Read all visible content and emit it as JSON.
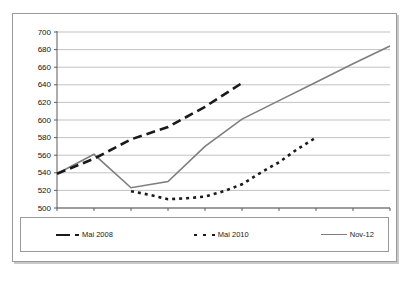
{
  "chart_data": {
    "type": "line",
    "title": "",
    "subtitle": "",
    "xlabel": "",
    "ylabel": "",
    "xlim": [
      2007,
      2016
    ],
    "ylim": [
      500,
      700
    ],
    "ytick_step": 20,
    "grid": true,
    "legend_position": "bottom",
    "categories": [
      2007,
      2008,
      2009,
      2010,
      2011,
      2012,
      2013,
      2014,
      2015,
      2016
    ],
    "xtick_labels": [
      "2007",
      "2008",
      "2009",
      "2010",
      "2011",
      "2012",
      "2013",
      "2014",
      "2015",
      "2016"
    ],
    "ytick_labels": [
      "500",
      "520",
      "540",
      "560",
      "580",
      "600",
      "620",
      "640",
      "660",
      "680",
      "700"
    ],
    "series": [
      {
        "name": "Mai 2008",
        "style": "long-dashed",
        "color": "#1a1a1a",
        "x": [
          2007,
          2008,
          2009,
          2010,
          2011,
          2012
        ],
        "values": [
          539,
          556,
          578,
          592,
          615,
          642
        ]
      },
      {
        "name": "Mai 2010",
        "style": "dotted",
        "color": "#1a1a1a",
        "x": [
          2009,
          2009.5,
          2010,
          2010.5,
          2011,
          2011.5,
          2012,
          2012.5,
          2013,
          2013.5,
          2014
        ],
        "values": [
          519,
          515,
          510,
          511,
          513,
          519,
          527,
          540,
          552,
          567,
          580
        ]
      },
      {
        "name": "Nov-12",
        "style": "solid",
        "color": "#7e7e7e",
        "x": [
          2007,
          2008,
          2009,
          2010,
          2011,
          2012,
          2013,
          2014,
          2015,
          2016
        ],
        "values": [
          539,
          561,
          523,
          530,
          570,
          601,
          622,
          643,
          664,
          684
        ]
      }
    ]
  },
  "legend": {
    "items": [
      {
        "label": "Mai 2008"
      },
      {
        "label": "Mai 2010"
      },
      {
        "label": "Nov-12"
      }
    ]
  },
  "axes": {
    "y_labels": [
      "700",
      "680",
      "660",
      "640",
      "620",
      "600",
      "580",
      "560",
      "540",
      "520",
      "500"
    ],
    "x_labels": [
      "2007",
      "2008",
      "2009",
      "2010",
      "2011",
      "2012",
      "2013",
      "2014",
      "2015",
      "2016"
    ]
  }
}
